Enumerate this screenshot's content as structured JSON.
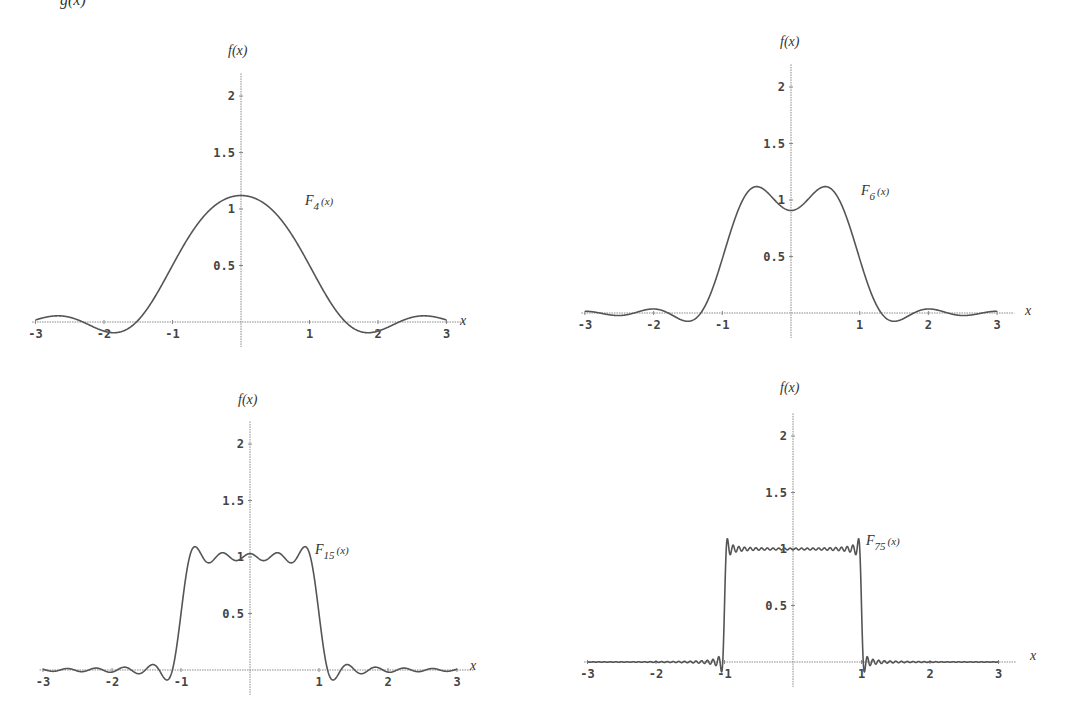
{
  "top_text_fragment": "g(x)",
  "chart_data": [
    {
      "type": "line",
      "title": "",
      "series": [
        {
          "name": "F_4(x)",
          "cutoff": 4
        }
      ],
      "label_main": "F",
      "label_sub": "4",
      "label_arg": "(x)",
      "xlabel": "x",
      "ylabel": "f(x)",
      "xlim": [
        -3,
        3
      ],
      "ylim": [
        0,
        2.2
      ],
      "xticks": [
        -3,
        -2,
        -1,
        1,
        2,
        3
      ],
      "yticks": [
        0.5,
        1,
        1.5,
        2
      ],
      "ytick_labels": [
        "0.5",
        "1",
        "1.5",
        "2"
      ],
      "xtick_labels": [
        "-3",
        "-2",
        "-1",
        "1",
        "2",
        "3"
      ],
      "description": "Fourier integral approximation of rectangular pulse (1 for |x|<1), peak ≈1.12 at x=0",
      "sample_points": {
        "x": [
          -3,
          -2,
          -1.5,
          -1,
          -0.5,
          0,
          0.5,
          1,
          1.5,
          2,
          3
        ],
        "y": [
          0.02,
          -0.05,
          0.0,
          0.5,
          0.96,
          1.12,
          0.96,
          0.5,
          0.0,
          -0.05,
          0.02
        ]
      },
      "px": {
        "ox": 241,
        "oy": 322,
        "sx": 68.5,
        "sy": 113,
        "flabel": [
          228,
          55
        ],
        "xlabel": [
          460,
          325
        ],
        "curveLabel": [
          305,
          205
        ]
      }
    },
    {
      "type": "line",
      "title": "",
      "series": [
        {
          "name": "F_6(x)",
          "cutoff": 6
        }
      ],
      "label_main": "F",
      "label_sub": "6",
      "label_arg": "(x)",
      "xlabel": "x",
      "ylabel": "f(x)",
      "xlim": [
        -3,
        3
      ],
      "ylim": [
        0,
        2.2
      ],
      "xticks": [
        -3,
        -2,
        -1,
        1,
        2,
        3
      ],
      "yticks": [
        0.5,
        1,
        1.5,
        2
      ],
      "ytick_labels": [
        "0.5",
        "1",
        "1.5",
        "2"
      ],
      "xtick_labels": [
        "-3",
        "-2",
        "-1",
        "1",
        "2",
        "3"
      ],
      "description": "Two peaks ≈1.12 near x=±0.5, dip ≈0.91 at x=0",
      "sample_points": {
        "x": [
          -3,
          -2,
          -1.4,
          -1,
          -0.5,
          0,
          0.5,
          1,
          1.4,
          2,
          3
        ],
        "y": [
          0.0,
          0.04,
          -0.08,
          0.5,
          1.12,
          0.91,
          1.12,
          0.5,
          -0.08,
          0.04,
          0.0
        ]
      },
      "px": {
        "ox": 791,
        "oy": 313,
        "sx": 68.7,
        "sy": 113,
        "flabel": [
          780,
          46
        ],
        "xlabel": [
          1025,
          315
        ],
        "curveLabel": [
          861,
          195
        ]
      }
    },
    {
      "type": "line",
      "title": "",
      "series": [
        {
          "name": "F_15(x)",
          "cutoff": 15
        }
      ],
      "label_main": "F",
      "label_sub": "15",
      "label_arg": "(x)",
      "xlabel": "x",
      "ylabel": "f(x)",
      "xlim": [
        -3,
        3
      ],
      "ylim": [
        0,
        2.2
      ],
      "xticks": [
        -3,
        -2,
        -1,
        1,
        2,
        3
      ],
      "yticks": [
        0.5,
        1,
        1.5,
        2
      ],
      "ytick_labels": [
        "0.5",
        "1",
        "1.5",
        "2"
      ],
      "xtick_labels": [
        "-3",
        "-2",
        "-1",
        "1",
        "2",
        "3"
      ],
      "description": "Near-rectangular with ripples ≈0.95–1.09 across |x|<1; overshoot ≈1.09 near edges",
      "sample_points": {
        "x": [
          -3,
          -1.1,
          -1,
          -0.85,
          0,
          0.85,
          1,
          1.1,
          3
        ],
        "y": [
          0.0,
          -0.08,
          0.5,
          1.09,
          1.02,
          1.09,
          0.5,
          -0.08,
          0.0
        ]
      },
      "px": {
        "ox": 250,
        "oy": 670,
        "sx": 69,
        "sy": 113,
        "flabel": [
          238,
          404
        ],
        "xlabel": [
          470,
          670
        ],
        "curveLabel": [
          315,
          554
        ]
      }
    },
    {
      "type": "line",
      "title": "",
      "series": [
        {
          "name": "F_75(x)",
          "cutoff": 75
        }
      ],
      "label_main": "F",
      "label_sub": "75",
      "label_arg": "(x)",
      "xlabel": "x",
      "ylabel": "f(x)",
      "xlim": [
        -3,
        3
      ],
      "ylim": [
        0,
        2.2
      ],
      "xticks": [
        -3,
        -2,
        -1,
        1,
        2,
        3
      ],
      "yticks": [
        0.5,
        1,
        1.5,
        2
      ],
      "ytick_labels": [
        "0.5",
        "1",
        "1.5",
        "2"
      ],
      "xtick_labels": [
        "-3",
        "-2",
        "-1",
        "1",
        "2",
        "3"
      ],
      "description": "Almost a perfect rectangle of height 1 on |x|<1 with small Gibbs overshoot ≈1.09 at x=±1",
      "sample_points": {
        "x": [
          -3,
          -1.01,
          -0.99,
          0,
          0.99,
          1.01,
          3
        ],
        "y": [
          0.0,
          0.0,
          1.09,
          1.0,
          1.09,
          0.0,
          0.0
        ]
      },
      "px": {
        "ox": 793,
        "oy": 662,
        "sx": 68.5,
        "sy": 113,
        "flabel": [
          780,
          392
        ],
        "xlabel": [
          1030,
          660
        ],
        "curveLabel": [
          866,
          545
        ]
      }
    }
  ]
}
